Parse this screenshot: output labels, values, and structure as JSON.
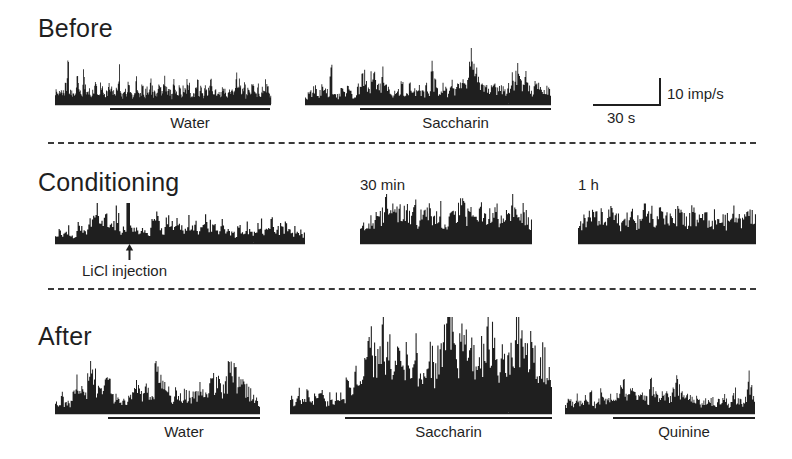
{
  "figure": {
    "title_hidden": "",
    "background": "#ffffff",
    "ink": "#1f1f1f",
    "width": 792,
    "height": 459
  },
  "rows": [
    {
      "id": "before",
      "label": "Before",
      "x": 38,
      "y": 14
    },
    {
      "id": "conditioning",
      "label": "Conditioning",
      "x": 38,
      "y": 168
    },
    {
      "id": "after",
      "label": "After",
      "x": 38,
      "y": 322
    }
  ],
  "dividers": [
    {
      "id": "divider-1",
      "x": 48,
      "y": 142,
      "width": 708
    },
    {
      "id": "divider-2",
      "x": 48,
      "y": 288,
      "width": 708
    }
  ],
  "scalebar": {
    "x": 593,
    "y": 78,
    "h_length": 68,
    "v_length": 27,
    "vertical_label": "10 imp/s",
    "horizontal_label": "30 s"
  },
  "annotations": [
    {
      "id": "licl-injection",
      "label": "LiCl injection",
      "arrow_x": 129,
      "arrow_top": 246,
      "arrow_bottom": 259,
      "label_x": 129,
      "label_y": 262
    }
  ],
  "time_labels": [
    {
      "id": "time-30min",
      "text": "30 min",
      "x": 360,
      "y": 176
    },
    {
      "id": "time-1h",
      "text": "1 h",
      "x": 578,
      "y": 176
    }
  ],
  "chart_data": {
    "type": "bar",
    "xlabel": "Time",
    "ylabel": "Firing rate (imp/s)",
    "grid": false,
    "legend": "none",
    "scale": {
      "vertical_unit": "10 imp/s",
      "horizontal_unit": "30 s"
    },
    "panels": [
      {
        "id": "before-water",
        "row": "Before",
        "stimulus": "Water",
        "x": 55,
        "baseline_y": 104,
        "width": 216,
        "max_height": 40,
        "peak_imp_s": 14,
        "mean_imp_s": 5,
        "stim_bar": {
          "start": 110,
          "end": 270
        },
        "seed": 101,
        "values": [
          4,
          3,
          6,
          5,
          4,
          7,
          14,
          6,
          4,
          3,
          5,
          8,
          4,
          3,
          9,
          6,
          4,
          5,
          3,
          4,
          6,
          5,
          4,
          7,
          5,
          3,
          4,
          6,
          5,
          4,
          3,
          5,
          12,
          4,
          3,
          5,
          4,
          6,
          5,
          3,
          4,
          7,
          5,
          4,
          6,
          3,
          5,
          4,
          8,
          5,
          4,
          3,
          6,
          5,
          4,
          9,
          6,
          4,
          5,
          3,
          7,
          5,
          4,
          6,
          3,
          5,
          4,
          8,
          6,
          4,
          3,
          5,
          7,
          4,
          5,
          3,
          6,
          4,
          5,
          8,
          6,
          4,
          3,
          5,
          4,
          7,
          5,
          3,
          4,
          6,
          5,
          4,
          10,
          7,
          5,
          4,
          6,
          3,
          5,
          4,
          7,
          5,
          4,
          6,
          3,
          5,
          4,
          6,
          5,
          3
        ]
      },
      {
        "id": "before-saccharin",
        "row": "Before",
        "stimulus": "Saccharin",
        "x": 305,
        "baseline_y": 104,
        "width": 246,
        "max_height": 52,
        "peak_imp_s": 19,
        "mean_imp_s": 6,
        "stim_bar": {
          "start": 360,
          "end": 551
        },
        "seed": 202,
        "values": [
          3,
          5,
          4,
          6,
          5,
          4,
          7,
          5,
          4,
          12,
          6,
          4,
          3,
          5,
          4,
          6,
          5,
          3,
          4,
          6,
          9,
          11,
          8,
          6,
          10,
          12,
          9,
          7,
          11,
          8,
          6,
          5,
          4,
          6,
          5,
          7,
          4,
          5,
          6,
          4,
          5,
          7,
          5,
          4,
          6,
          5,
          13,
          8,
          5,
          4,
          6,
          5,
          4,
          7,
          5,
          6,
          8,
          7,
          6,
          9,
          19,
          14,
          11,
          9,
          8,
          7,
          6,
          5,
          7,
          6,
          5,
          8,
          6,
          5,
          7,
          9,
          8,
          11,
          9,
          7,
          10,
          8,
          6,
          5,
          7,
          6,
          5,
          4,
          6,
          5
        ]
      },
      {
        "id": "conditioning-licl",
        "row": "Conditioning",
        "stimulus": "",
        "x": 55,
        "baseline_y": 243,
        "width": 250,
        "max_height": 36,
        "peak_imp_s": 13,
        "mean_imp_s": 5,
        "stim_bar": null,
        "seed": 303,
        "values": [
          3,
          4,
          3,
          5,
          4,
          3,
          6,
          5,
          4,
          7,
          9,
          12,
          8,
          7,
          9,
          6,
          8,
          10,
          5,
          6,
          13,
          7,
          5,
          4,
          6,
          5,
          4,
          7,
          9,
          6,
          5,
          8,
          6,
          5,
          7,
          6,
          5,
          8,
          6,
          7,
          5,
          6,
          8,
          7,
          6,
          5,
          7,
          6,
          5,
          4,
          3,
          5,
          4,
          6,
          5,
          4,
          6,
          7,
          5,
          6,
          8,
          6,
          5,
          7,
          6,
          5,
          4,
          5,
          4,
          3
        ]
      },
      {
        "id": "conditioning-30min",
        "row": "Conditioning",
        "stimulus": "",
        "time_label": "30 min",
        "x": 360,
        "baseline_y": 243,
        "width": 172,
        "max_height": 45,
        "peak_imp_s": 16,
        "mean_imp_s": 9,
        "stim_bar": null,
        "seed": 404,
        "values": [
          6,
          8,
          7,
          9,
          8,
          10,
          9,
          12,
          16,
          13,
          11,
          10,
          12,
          9,
          11,
          13,
          10,
          12,
          9,
          11,
          10,
          13,
          11,
          9,
          10,
          12,
          9,
          8,
          10,
          9,
          11,
          13,
          15,
          12,
          10,
          11,
          9,
          10,
          12,
          9,
          8,
          10,
          9,
          11,
          9,
          8,
          10,
          12,
          14,
          11,
          9,
          8,
          10,
          9,
          7
        ]
      },
      {
        "id": "conditioning-1h",
        "row": "Conditioning",
        "stimulus": "",
        "time_label": "1 h",
        "x": 578,
        "baseline_y": 243,
        "width": 178,
        "max_height": 40,
        "peak_imp_s": 14,
        "mean_imp_s": 8,
        "stim_bar": null,
        "seed": 505,
        "values": [
          6,
          8,
          7,
          10,
          9,
          11,
          8,
          10,
          9,
          12,
          10,
          8,
          9,
          7,
          8,
          10,
          9,
          7,
          8,
          10,
          12,
          14,
          11,
          9,
          8,
          10,
          9,
          11,
          8,
          9,
          10,
          12,
          9,
          8,
          10,
          11,
          9,
          8,
          10,
          9,
          7,
          8,
          10,
          9,
          11,
          8,
          9,
          10,
          12,
          9,
          8,
          10,
          9,
          11,
          8
        ]
      },
      {
        "id": "after-water",
        "row": "After",
        "stimulus": "Water",
        "x": 55,
        "baseline_y": 413,
        "width": 205,
        "max_height": 48,
        "peak_imp_s": 17,
        "mean_imp_s": 6,
        "stim_bar": {
          "start": 108,
          "end": 260
        },
        "seed": 606,
        "values": [
          3,
          2,
          5,
          3,
          4,
          3,
          8,
          11,
          9,
          7,
          6,
          9,
          12,
          10,
          8,
          7,
          9,
          11,
          8,
          6,
          5,
          4,
          3,
          5,
          4,
          6,
          5,
          8,
          7,
          6,
          9,
          7,
          5,
          6,
          13,
          11,
          9,
          7,
          6,
          5,
          4,
          6,
          5,
          4,
          6,
          5,
          4,
          6,
          5,
          7,
          6,
          5,
          8,
          10,
          9,
          11,
          8,
          7,
          9,
          12,
          14,
          11,
          9,
          13,
          10,
          8,
          6,
          5,
          4,
          3
        ]
      },
      {
        "id": "after-saccharin",
        "row": "After",
        "stimulus": "Saccharin",
        "x": 290,
        "baseline_y": 413,
        "width": 262,
        "max_height": 92,
        "peak_imp_s": 33,
        "mean_imp_s": 14,
        "stim_bar": {
          "start": 345,
          "end": 552
        },
        "seed": 707,
        "values": [
          5,
          4,
          7,
          5,
          4,
          8,
          6,
          5,
          9,
          7,
          5,
          4,
          6,
          5,
          8,
          6,
          5,
          10,
          8,
          12,
          14,
          11,
          16,
          20,
          26,
          22,
          18,
          25,
          30,
          24,
          20,
          17,
          22,
          19,
          16,
          21,
          18,
          15,
          20,
          17,
          14,
          19,
          22,
          18,
          15,
          20,
          24,
          28,
          33,
          29,
          24,
          20,
          26,
          22,
          19,
          24,
          20,
          17,
          22,
          26,
          31,
          27,
          23,
          19,
          24,
          21,
          18,
          23,
          27,
          32,
          28,
          24,
          20,
          25,
          22,
          18,
          16,
          20,
          17,
          14
        ]
      },
      {
        "id": "after-quinine",
        "row": "After",
        "stimulus": "Quinine",
        "x": 565,
        "baseline_y": 413,
        "width": 190,
        "max_height": 42,
        "peak_imp_s": 15,
        "mean_imp_s": 5,
        "stim_bar": {
          "start": 613,
          "end": 755
        },
        "seed": 808,
        "values": [
          3,
          5,
          4,
          3,
          6,
          4,
          3,
          5,
          4,
          6,
          4,
          3,
          5,
          7,
          5,
          4,
          6,
          5,
          4,
          7,
          9,
          11,
          8,
          6,
          9,
          7,
          5,
          6,
          8,
          6,
          5,
          15,
          9,
          7,
          5,
          6,
          8,
          6,
          5,
          7,
          9,
          11,
          8,
          6,
          5,
          7,
          5,
          4,
          6,
          4,
          3,
          5,
          4,
          6,
          4,
          3,
          5,
          4,
          6,
          4,
          3,
          5,
          7,
          5,
          4,
          3,
          5,
          12,
          8,
          5
        ]
      }
    ]
  }
}
